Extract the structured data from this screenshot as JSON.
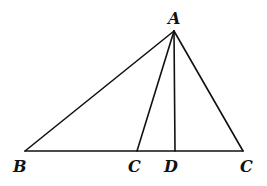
{
  "diagram": {
    "type": "triangle-geometry",
    "points": {
      "A": {
        "x": 174,
        "y": 31,
        "label": "A",
        "label_x": 168,
        "label_y": 24
      },
      "B": {
        "x": 25,
        "y": 151,
        "label": "B",
        "label_x": 13,
        "label_y": 172
      },
      "C1": {
        "x": 137,
        "y": 151,
        "label": "C",
        "label_x": 128,
        "label_y": 172
      },
      "D": {
        "x": 175,
        "y": 151,
        "label": "D",
        "label_x": 164,
        "label_y": 172
      },
      "C2": {
        "x": 243,
        "y": 151,
        "label": "C",
        "label_x": 240,
        "label_y": 172
      }
    },
    "segments": [
      {
        "from": "A",
        "to": "B"
      },
      {
        "from": "A",
        "to": "C1"
      },
      {
        "from": "A",
        "to": "D"
      },
      {
        "from": "A",
        "to": "C2"
      },
      {
        "from": "B",
        "to": "C2"
      }
    ],
    "stroke_color": "#111111",
    "labels": [
      "A",
      "B",
      "C",
      "D",
      "C"
    ]
  }
}
